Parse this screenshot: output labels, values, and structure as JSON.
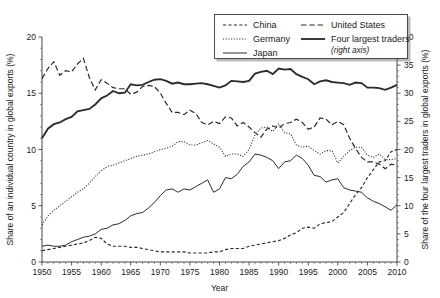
{
  "chart_data": {
    "type": "line",
    "title": "",
    "xlabel": "Year",
    "ylabel_left": "Share of an individual country in global exports (%)",
    "ylabel_right": "Share of the four largest traders in global exports (%)",
    "xlim": [
      1950,
      2010
    ],
    "ylim_left": [
      0,
      20
    ],
    "ylim_right": [
      0,
      40
    ],
    "xticks": [
      1950,
      1955,
      1960,
      1965,
      1970,
      1975,
      1980,
      1985,
      1990,
      1995,
      2000,
      2005,
      2010
    ],
    "yticks_left": [
      0,
      5,
      10,
      15,
      20
    ],
    "yticks_right": [
      0,
      5,
      10,
      15,
      20,
      25,
      30,
      35,
      40
    ],
    "grid": false,
    "legend_position": "top-right",
    "legend_note": "(right axis)",
    "x": [
      1950,
      1951,
      1952,
      1953,
      1954,
      1955,
      1956,
      1957,
      1958,
      1959,
      1960,
      1961,
      1962,
      1963,
      1964,
      1965,
      1966,
      1967,
      1968,
      1969,
      1970,
      1971,
      1972,
      1973,
      1974,
      1975,
      1976,
      1977,
      1978,
      1979,
      1980,
      1981,
      1982,
      1983,
      1984,
      1985,
      1986,
      1987,
      1988,
      1989,
      1990,
      1991,
      1992,
      1993,
      1994,
      1995,
      1996,
      1997,
      1998,
      1999,
      2000,
      2001,
      2002,
      2003,
      2004,
      2005,
      2006,
      2007,
      2008,
      2009,
      2010
    ],
    "series": [
      {
        "name": "China",
        "axis": "left",
        "style": "dashed",
        "values": [
          1.0,
          1.1,
          1.2,
          1.3,
          1.4,
          1.5,
          1.6,
          1.7,
          1.9,
          2.2,
          2.1,
          1.6,
          1.4,
          1.4,
          1.4,
          1.3,
          1.3,
          1.2,
          1.1,
          1.0,
          0.9,
          0.9,
          0.9,
          0.9,
          0.9,
          0.8,
          0.8,
          0.8,
          0.8,
          0.9,
          0.9,
          1.1,
          1.2,
          1.2,
          1.2,
          1.4,
          1.5,
          1.6,
          1.7,
          1.8,
          1.9,
          2.1,
          2.4,
          2.6,
          3.0,
          3.1,
          3.0,
          3.4,
          3.5,
          3.6,
          4.0,
          4.4,
          5.2,
          6.0,
          6.6,
          7.5,
          8.2,
          8.9,
          9.0,
          9.8,
          10.0
        ]
      },
      {
        "name": "Germany",
        "axis": "left",
        "style": "dotted",
        "values": [
          3.3,
          4.1,
          4.6,
          5.0,
          5.4,
          5.8,
          6.2,
          6.5,
          7.0,
          7.6,
          8.1,
          8.5,
          8.6,
          8.8,
          9.0,
          9.2,
          9.4,
          9.5,
          9.6,
          9.8,
          10.0,
          10.1,
          10.3,
          10.7,
          10.7,
          10.4,
          10.4,
          10.6,
          10.8,
          10.5,
          10.2,
          9.4,
          9.6,
          9.6,
          9.4,
          10.0,
          11.3,
          11.9,
          12.0,
          11.6,
          12.3,
          11.5,
          11.4,
          10.4,
          10.2,
          10.3,
          9.9,
          9.6,
          9.9,
          9.9,
          8.8,
          9.4,
          9.9,
          10.2,
          10.2,
          9.5,
          9.3,
          9.6,
          9.1,
          9.1,
          9.2
        ]
      },
      {
        "name": "Japan",
        "axis": "left",
        "style": "solid",
        "values": [
          1.4,
          1.5,
          1.4,
          1.4,
          1.5,
          1.8,
          2.0,
          2.2,
          2.3,
          2.5,
          2.9,
          3.0,
          3.3,
          3.4,
          3.7,
          4.1,
          4.3,
          4.4,
          4.8,
          5.3,
          5.9,
          6.4,
          6.5,
          6.2,
          6.5,
          6.4,
          6.7,
          7.0,
          7.3,
          6.2,
          6.5,
          7.5,
          7.4,
          7.8,
          8.5,
          8.9,
          9.6,
          9.5,
          9.3,
          9.0,
          8.3,
          8.9,
          9.0,
          9.5,
          9.2,
          8.6,
          7.7,
          7.6,
          7.1,
          7.3,
          7.4,
          6.6,
          6.4,
          6.3,
          6.2,
          5.7,
          5.4,
          5.2,
          4.9,
          4.6,
          5.1
        ]
      },
      {
        "name": "United States",
        "axis": "left",
        "style": "long-dashed",
        "values": [
          16.3,
          17.2,
          17.8,
          16.6,
          17.0,
          16.9,
          17.6,
          18.1,
          16.4,
          15.3,
          16.2,
          15.9,
          15.5,
          15.4,
          15.4,
          14.9,
          15.1,
          15.6,
          15.7,
          15.6,
          15.0,
          14.1,
          13.3,
          13.3,
          13.1,
          13.5,
          13.2,
          12.4,
          12.2,
          12.5,
          12.3,
          12.9,
          12.8,
          12.1,
          12.4,
          12.0,
          11.5,
          11.1,
          11.8,
          12.1,
          11.9,
          12.3,
          12.4,
          12.7,
          12.4,
          11.8,
          12.0,
          12.8,
          12.7,
          12.2,
          12.5,
          12.2,
          11.0,
          10.1,
          9.3,
          8.9,
          8.9,
          8.7,
          8.3,
          8.7,
          8.6
        ]
      },
      {
        "name": "Four largest traders",
        "axis": "right",
        "style": "solid-thick",
        "values": [
          22.0,
          23.7,
          24.5,
          24.8,
          25.4,
          25.8,
          26.8,
          27.0,
          27.2,
          28.0,
          29.1,
          29.6,
          30.4,
          30.0,
          30.1,
          31.6,
          31.4,
          31.5,
          32.0,
          32.4,
          32.5,
          32.2,
          31.7,
          31.9,
          31.6,
          31.6,
          31.7,
          31.8,
          31.6,
          31.3,
          31.0,
          31.4,
          32.2,
          32.1,
          32.0,
          32.2,
          33.5,
          33.8,
          34.0,
          33.4,
          34.4,
          34.2,
          34.3,
          33.4,
          32.9,
          32.5,
          31.6,
          32.1,
          32.3,
          32.0,
          31.9,
          31.8,
          31.5,
          31.9,
          31.8,
          31.0,
          31.0,
          30.9,
          30.6,
          31.0,
          31.5
        ]
      }
    ]
  },
  "legend": {
    "items": [
      {
        "label": "China",
        "style": "dashed"
      },
      {
        "label": "Germany",
        "style": "dotted"
      },
      {
        "label": "Japan",
        "style": "solid"
      },
      {
        "label": "United States",
        "style": "long-dashed"
      },
      {
        "label": "Four largest traders",
        "style": "solid-thick"
      }
    ],
    "note": "(right axis)"
  },
  "axes": {
    "x_title": "Year",
    "y_left_title": "Share of an individual country in global exports (%)",
    "y_right_title": "Share of the four largest traders in global exports (%)"
  }
}
